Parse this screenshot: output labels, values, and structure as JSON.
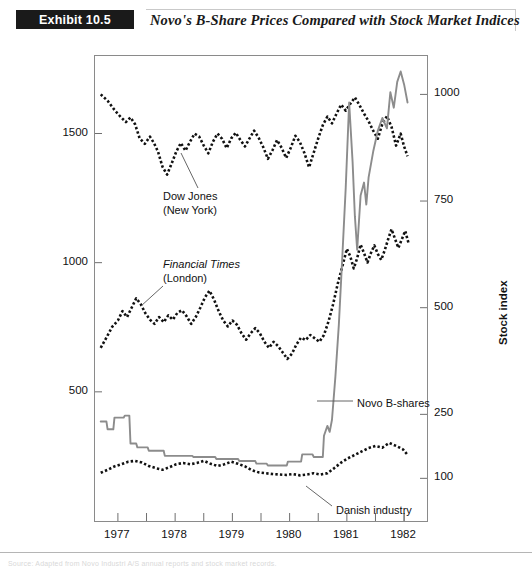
{
  "header": {
    "exhibit_tag": "Exhibit 10.5",
    "title": "Novo's B-Share Prices Compared with Stock Market Indices"
  },
  "footer": {
    "source": "Source: Adapted from Novo Industri A/S annual reports and stock market records."
  },
  "chart_data": {
    "type": "line",
    "title": "Novo's B-Share Prices Compared with Stock Market Indices",
    "xlabel": "",
    "ylabel": "Novo B-share price",
    "y2label": "Stock index",
    "grid": false,
    "legend": "inline-annotations",
    "xlim": [
      1976.6,
      1982.4
    ],
    "x_ticks": [
      1977,
      1978,
      1979,
      1980,
      1981,
      1982
    ],
    "x_tick_labels": [
      "1977",
      "1978",
      "1979",
      "1980",
      "1981",
      "1982"
    ],
    "x_minor_ticks": [
      1977.5,
      1978.5,
      1979.5,
      1980.5,
      1981.5,
      1982.0
    ],
    "ylim": [
      0,
      1800
    ],
    "y_ticks": [
      500,
      1000,
      1500
    ],
    "y_tick_labels": [
      "500",
      "1000",
      "1500"
    ],
    "y2lim": [
      0,
      1090
    ],
    "y2_ticks": [
      100,
      250,
      500,
      750,
      1000
    ],
    "y2_tick_labels": [
      "100",
      "250",
      "500",
      "750",
      "1000"
    ],
    "annotations": [
      {
        "name": "dow-jones-label",
        "line1": "Dow Jones",
        "line2": "(New York)",
        "line1_italic": false,
        "x_px": 163,
        "y_px": 190
      },
      {
        "name": "financial-times-label",
        "line1": "Financial Times",
        "line2": "(London)",
        "line1_italic": true,
        "x_px": 163,
        "y_px": 258
      },
      {
        "name": "novo-b-shares-label",
        "line1": "Novo B-shares",
        "line2": "",
        "line1_italic": false,
        "x_px": 357,
        "y_px": 397
      },
      {
        "name": "danish-industry-label",
        "line1": "Danish industry",
        "line2": "",
        "line1_italic": false,
        "x_px": 336,
        "y_px": 504
      }
    ],
    "series": [
      {
        "name": "Dow Jones (New York)",
        "axis": "right",
        "style": "dotted",
        "color": "#111111",
        "points": [
          [
            1976.7,
            1000
          ],
          [
            1976.82,
            985
          ],
          [
            1976.95,
            962
          ],
          [
            1977.05,
            947
          ],
          [
            1977.14,
            935
          ],
          [
            1977.22,
            946
          ],
          [
            1977.3,
            930
          ],
          [
            1977.38,
            897
          ],
          [
            1977.47,
            884
          ],
          [
            1977.56,
            901
          ],
          [
            1977.63,
            886
          ],
          [
            1977.7,
            866
          ],
          [
            1977.78,
            830
          ],
          [
            1977.86,
            812
          ],
          [
            1977.94,
            838
          ],
          [
            1978.02,
            866
          ],
          [
            1978.1,
            886
          ],
          [
            1978.18,
            868
          ],
          [
            1978.26,
            889
          ],
          [
            1978.34,
            908
          ],
          [
            1978.42,
            901
          ],
          [
            1978.5,
            880
          ],
          [
            1978.58,
            862
          ],
          [
            1978.66,
            889
          ],
          [
            1978.74,
            908
          ],
          [
            1978.82,
            896
          ],
          [
            1978.9,
            874
          ],
          [
            1978.98,
            897
          ],
          [
            1979.06,
            910
          ],
          [
            1979.14,
            893
          ],
          [
            1979.22,
            878
          ],
          [
            1979.3,
            897
          ],
          [
            1979.38,
            915
          ],
          [
            1979.46,
            898
          ],
          [
            1979.54,
            876
          ],
          [
            1979.62,
            849
          ],
          [
            1979.7,
            869
          ],
          [
            1979.78,
            893
          ],
          [
            1979.86,
            875
          ],
          [
            1979.94,
            851
          ],
          [
            1980.02,
            875
          ],
          [
            1980.1,
            903
          ],
          [
            1980.18,
            888
          ],
          [
            1980.26,
            862
          ],
          [
            1980.34,
            829
          ],
          [
            1980.42,
            863
          ],
          [
            1980.5,
            897
          ],
          [
            1980.58,
            928
          ],
          [
            1980.66,
            948
          ],
          [
            1980.74,
            932
          ],
          [
            1980.82,
            955
          ],
          [
            1980.9,
            976
          ],
          [
            1980.98,
            962
          ],
          [
            1981.06,
            978
          ],
          [
            1981.14,
            993
          ],
          [
            1981.22,
            975
          ],
          [
            1981.3,
            955
          ],
          [
            1981.38,
            937
          ],
          [
            1981.46,
            915
          ],
          [
            1981.54,
            896
          ],
          [
            1981.62,
            931
          ],
          [
            1981.7,
            949
          ],
          [
            1981.78,
            924
          ],
          [
            1981.86,
            880
          ],
          [
            1981.94,
            908
          ],
          [
            1982.0,
            878
          ],
          [
            1982.06,
            855
          ]
        ]
      },
      {
        "name": "Financial Times (London)",
        "axis": "right",
        "style": "dotted",
        "color": "#111111",
        "points": [
          [
            1976.7,
            406
          ],
          [
            1976.8,
            430
          ],
          [
            1976.9,
            455
          ],
          [
            1977.0,
            470
          ],
          [
            1977.08,
            492
          ],
          [
            1977.16,
            478
          ],
          [
            1977.24,
            500
          ],
          [
            1977.32,
            522
          ],
          [
            1977.4,
            508
          ],
          [
            1977.48,
            487
          ],
          [
            1977.56,
            472
          ],
          [
            1977.64,
            462
          ],
          [
            1977.72,
            478
          ],
          [
            1977.8,
            466
          ],
          [
            1977.88,
            482
          ],
          [
            1977.96,
            472
          ],
          [
            1978.04,
            488
          ],
          [
            1978.12,
            494
          ],
          [
            1978.2,
            480
          ],
          [
            1978.28,
            462
          ],
          [
            1978.36,
            478
          ],
          [
            1978.44,
            500
          ],
          [
            1978.52,
            524
          ],
          [
            1978.6,
            540
          ],
          [
            1978.68,
            519
          ],
          [
            1978.76,
            492
          ],
          [
            1978.84,
            470
          ],
          [
            1978.92,
            456
          ],
          [
            1979.0,
            470
          ],
          [
            1979.08,
            460
          ],
          [
            1979.16,
            440
          ],
          [
            1979.24,
            425
          ],
          [
            1979.32,
            440
          ],
          [
            1979.4,
            452
          ],
          [
            1979.48,
            440
          ],
          [
            1979.56,
            420
          ],
          [
            1979.64,
            406
          ],
          [
            1979.72,
            420
          ],
          [
            1979.8,
            410
          ],
          [
            1979.88,
            395
          ],
          [
            1979.96,
            380
          ],
          [
            1980.04,
            392
          ],
          [
            1980.12,
            414
          ],
          [
            1980.2,
            430
          ],
          [
            1980.28,
            424
          ],
          [
            1980.36,
            436
          ],
          [
            1980.44,
            428
          ],
          [
            1980.52,
            420
          ],
          [
            1980.6,
            436
          ],
          [
            1980.68,
            468
          ],
          [
            1980.76,
            508
          ],
          [
            1980.84,
            556
          ],
          [
            1980.92,
            596
          ],
          [
            1981.0,
            638
          ],
          [
            1981.06,
            620
          ],
          [
            1981.12,
            592
          ],
          [
            1981.18,
            616
          ],
          [
            1981.24,
            648
          ],
          [
            1981.3,
            628
          ],
          [
            1981.36,
            606
          ],
          [
            1981.42,
            628
          ],
          [
            1981.48,
            646
          ],
          [
            1981.54,
            626
          ],
          [
            1981.6,
            612
          ],
          [
            1981.66,
            634
          ],
          [
            1981.72,
            660
          ],
          [
            1981.78,
            684
          ],
          [
            1981.84,
            662
          ],
          [
            1981.9,
            640
          ],
          [
            1981.96,
            660
          ],
          [
            1982.02,
            680
          ],
          [
            1982.08,
            650
          ]
        ]
      },
      {
        "name": "Novo B-shares",
        "axis": "left",
        "style": "solid",
        "color": "#8c8c8c",
        "points": [
          [
            1976.7,
            385
          ],
          [
            1976.8,
            385
          ],
          [
            1976.82,
            355
          ],
          [
            1976.92,
            355
          ],
          [
            1976.94,
            400
          ],
          [
            1977.1,
            400
          ],
          [
            1977.12,
            408
          ],
          [
            1977.2,
            408
          ],
          [
            1977.22,
            300
          ],
          [
            1977.32,
            300
          ],
          [
            1977.34,
            285
          ],
          [
            1977.52,
            285
          ],
          [
            1977.54,
            272
          ],
          [
            1977.8,
            272
          ],
          [
            1977.82,
            252
          ],
          [
            1978.3,
            252
          ],
          [
            1978.32,
            248
          ],
          [
            1978.7,
            248
          ],
          [
            1978.72,
            240
          ],
          [
            1979.1,
            240
          ],
          [
            1979.12,
            232
          ],
          [
            1979.4,
            232
          ],
          [
            1979.42,
            222
          ],
          [
            1979.6,
            222
          ],
          [
            1979.62,
            215
          ],
          [
            1979.95,
            215
          ],
          [
            1979.97,
            230
          ],
          [
            1980.2,
            230
          ],
          [
            1980.22,
            258
          ],
          [
            1980.4,
            258
          ],
          [
            1980.42,
            248
          ],
          [
            1980.58,
            248
          ],
          [
            1980.6,
            330
          ],
          [
            1980.66,
            368
          ],
          [
            1980.7,
            345
          ],
          [
            1980.74,
            392
          ],
          [
            1980.8,
            560
          ],
          [
            1980.86,
            760
          ],
          [
            1980.92,
            1020
          ],
          [
            1980.98,
            1290
          ],
          [
            1981.04,
            1620
          ],
          [
            1981.1,
            1390
          ],
          [
            1981.14,
            1180
          ],
          [
            1981.18,
            1050
          ],
          [
            1981.24,
            1260
          ],
          [
            1981.3,
            1310
          ],
          [
            1981.34,
            1225
          ],
          [
            1981.38,
            1330
          ],
          [
            1981.46,
            1430
          ],
          [
            1981.54,
            1510
          ],
          [
            1981.62,
            1560
          ],
          [
            1981.7,
            1520
          ],
          [
            1981.76,
            1660
          ],
          [
            1981.82,
            1600
          ],
          [
            1981.88,
            1700
          ],
          [
            1981.94,
            1740
          ],
          [
            1982.0,
            1690
          ],
          [
            1982.06,
            1620
          ]
        ]
      },
      {
        "name": "Danish industry",
        "axis": "right",
        "style": "dotted",
        "color": "#111111",
        "points": [
          [
            1976.7,
            113
          ],
          [
            1976.82,
            120
          ],
          [
            1976.94,
            128
          ],
          [
            1977.06,
            133
          ],
          [
            1977.18,
            139
          ],
          [
            1977.3,
            141
          ],
          [
            1977.42,
            137
          ],
          [
            1977.54,
            129
          ],
          [
            1977.66,
            124
          ],
          [
            1977.78,
            120
          ],
          [
            1977.9,
            126
          ],
          [
            1978.02,
            133
          ],
          [
            1978.14,
            136
          ],
          [
            1978.26,
            133
          ],
          [
            1978.38,
            136
          ],
          [
            1978.5,
            141
          ],
          [
            1978.62,
            134
          ],
          [
            1978.74,
            129
          ],
          [
            1978.86,
            133
          ],
          [
            1978.98,
            139
          ],
          [
            1979.1,
            134
          ],
          [
            1979.22,
            128
          ],
          [
            1979.34,
            119
          ],
          [
            1979.46,
            114
          ],
          [
            1979.58,
            112
          ],
          [
            1979.7,
            110
          ],
          [
            1979.82,
            109
          ],
          [
            1979.94,
            108
          ],
          [
            1980.06,
            110
          ],
          [
            1980.18,
            107
          ],
          [
            1980.3,
            109
          ],
          [
            1980.42,
            112
          ],
          [
            1980.54,
            109
          ],
          [
            1980.66,
            112
          ],
          [
            1980.78,
            124
          ],
          [
            1980.9,
            137
          ],
          [
            1981.02,
            147
          ],
          [
            1981.14,
            155
          ],
          [
            1981.26,
            163
          ],
          [
            1981.38,
            171
          ],
          [
            1981.5,
            176
          ],
          [
            1981.62,
            172
          ],
          [
            1981.74,
            183
          ],
          [
            1981.86,
            176
          ],
          [
            1981.98,
            168
          ],
          [
            1982.06,
            155
          ]
        ]
      }
    ]
  }
}
